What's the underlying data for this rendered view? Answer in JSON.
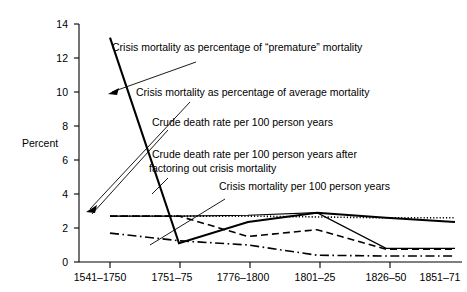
{
  "chart_data": {
    "type": "line",
    "title": "",
    "xlabel": "",
    "ylabel": "Percent",
    "ylim": [
      0,
      14
    ],
    "yticks": [
      0,
      2,
      4,
      6,
      8,
      10,
      12,
      14
    ],
    "grid": false,
    "legend_position": "inline-annotations",
    "categories": [
      "1541–1750",
      "1751–75",
      "1776–1800",
      "1801–25",
      "1826–50",
      "1851–71"
    ],
    "series": [
      {
        "name": "Crisis mortality as percentage of \"premature\" mortality",
        "style": "solid-thick",
        "values": [
          13.2,
          1.1,
          2.35,
          2.9,
          2.6,
          2.35
        ]
      },
      {
        "name": "Crisis mortality as percentage of average mortality",
        "style": "dotted",
        "values": [
          2.7,
          2.7,
          2.7,
          2.65,
          2.6,
          2.6
        ]
      },
      {
        "name": "Crude death rate per 100 person years",
        "style": "solid-thin",
        "values": [
          2.7,
          2.7,
          2.75,
          2.9,
          0.8,
          0.8
        ]
      },
      {
        "name": "Crude death rate per 100 person years after factoring out crisis mortality",
        "style": "dashed",
        "values": [
          2.7,
          2.7,
          1.5,
          1.9,
          0.75,
          0.75
        ]
      },
      {
        "name": "Crisis mortality per 100 person years",
        "style": "dash-dot",
        "values": [
          1.7,
          1.25,
          1.0,
          0.4,
          0.35,
          0.35
        ]
      }
    ],
    "annotations": [
      {
        "text": "Crisis mortality as percentage of \"premature\" mortality",
        "target_series": "Crisis mortality as percentage of \"premature\" mortality"
      },
      {
        "text": "Crisis mortality as percentage of average mortality",
        "target_series": "Crisis mortality as percentage of average mortality"
      },
      {
        "text": "Crude death rate per 100 person years",
        "target_series": "Crude death rate per 100 person years"
      },
      {
        "text_line1": "Crude death rate per 100 person years after",
        "text_line2": "factoring out crisis mortality",
        "target_series": "Crude death rate per 100 person years after factoring out crisis mortality"
      },
      {
        "text": "Crisis mortality per 100 person years",
        "target_series": "Crisis mortality per 100 person years"
      }
    ]
  },
  "axis": {
    "y_label": "Percent",
    "y_ticks": [
      "14",
      "12",
      "10",
      "8",
      "6",
      "4",
      "2",
      "0"
    ],
    "x_ticks": [
      "1541–1750",
      "1751–75",
      "1776–1800",
      "1801–25",
      "1826–50",
      "1851–71"
    ]
  },
  "annotations": {
    "a1": "Crisis mortality as percentage of “premature” mortality",
    "a2": "Crisis mortality as percentage of average mortality",
    "a3": "Crude death rate per 100 person years",
    "a4_line1": "Crude death rate per 100 person years after",
    "a4_line2": "factoring out crisis mortality",
    "a5": "Crisis mortality per 100 person years"
  },
  "colors": {
    "ink": "#000000",
    "background": "#ffffff"
  }
}
